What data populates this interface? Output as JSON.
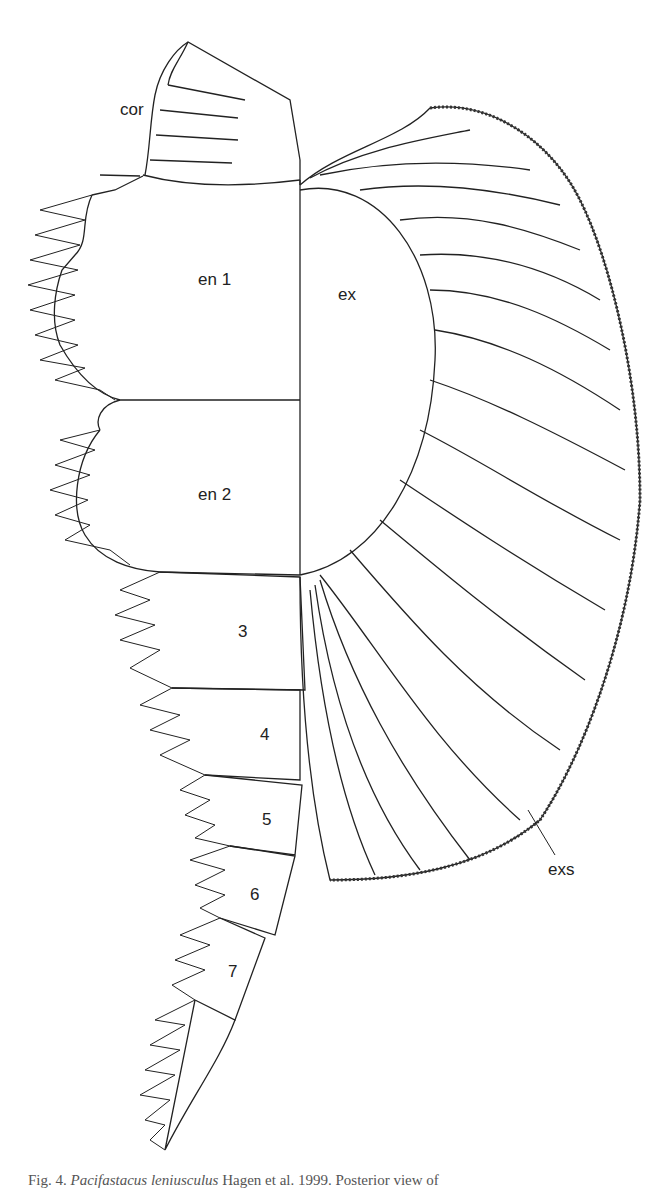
{
  "figure": {
    "labels": {
      "coxa": "cor",
      "endopod_1": "en 1",
      "endopod_2": "en 2",
      "exopod": "ex",
      "seg3": "3",
      "seg4": "4",
      "seg5": "5",
      "seg6": "6",
      "seg7": "7",
      "exopod_setae": "exs"
    },
    "caption": {
      "prefix": "Fig. 4.",
      "taxon": "Pacifastacus leniusculus",
      "rest": " Hagen et al. 1999. Posterior view of"
    }
  }
}
